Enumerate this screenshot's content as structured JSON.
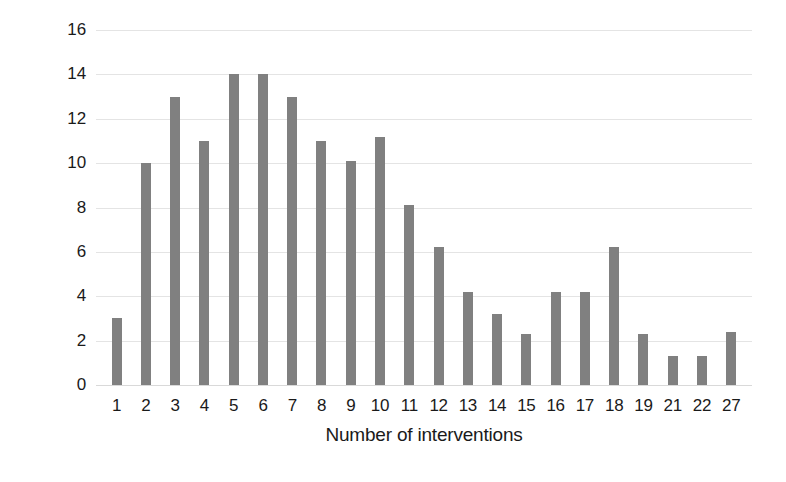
{
  "chart_data": {
    "type": "bar",
    "title": "",
    "xlabel": "Number of interventions",
    "ylabel": "Number of reports",
    "categories": [
      "1",
      "2",
      "3",
      "4",
      "5",
      "6",
      "7",
      "8",
      "9",
      "10",
      "11",
      "12",
      "13",
      "14",
      "15",
      "16",
      "17",
      "18",
      "19",
      "21",
      "22",
      "27"
    ],
    "values": [
      3,
      10,
      13,
      11,
      14,
      14,
      13,
      11,
      10.1,
      11.2,
      8.1,
      6.2,
      4.2,
      3.2,
      2.3,
      4.2,
      4.2,
      6.2,
      2.3,
      1.3,
      1.3,
      2.4
    ],
    "series": [
      {
        "name": "Number of reports",
        "values": [
          3,
          10,
          13,
          11,
          14,
          14,
          13,
          11,
          10.1,
          11.2,
          8.1,
          6.2,
          4.2,
          3.2,
          2.3,
          4.2,
          4.2,
          6.2,
          2.3,
          1.3,
          1.3,
          2.4
        ]
      }
    ],
    "ylim": [
      0,
      16
    ],
    "yticks": [
      "16",
      "14",
      "12",
      "10",
      "8",
      "6",
      "4",
      "2",
      "0"
    ],
    "ytick_values": [
      16,
      14,
      12,
      10,
      8,
      6,
      4,
      2,
      0
    ],
    "grid": true,
    "legend": false,
    "bar_color": "#808080",
    "gridline_color": "#e4e4e4",
    "background_color": "#ffffff",
    "text_color": "#1a1a1a"
  }
}
